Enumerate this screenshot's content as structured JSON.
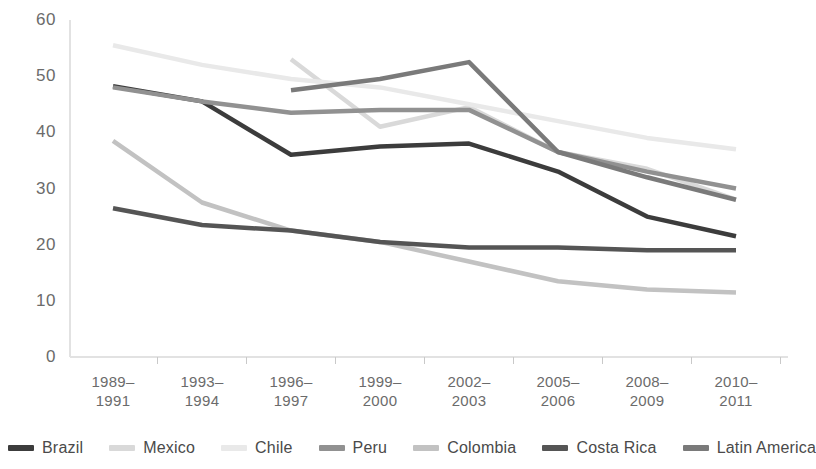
{
  "chart_data": {
    "type": "line",
    "title": "",
    "subtitle": "",
    "xlabel": "",
    "ylabel": "",
    "ylim": [
      0,
      60
    ],
    "ytick_values": [
      60,
      50,
      40,
      30,
      20,
      10,
      0
    ],
    "ytick_labels": [
      "60",
      "50",
      "40",
      "30",
      "20",
      "10",
      "0"
    ],
    "grid": false,
    "legend_position": "bottom",
    "categories": [
      "1989–\n1991",
      "1993–\n1994",
      "1996–\n1997",
      "1999–\n2000",
      "2002–\n2003",
      "2005–\n2006",
      "2008–\n2009",
      "2010–\n2011"
    ],
    "series": [
      {
        "name": "Brazil",
        "color": "#3c3c3c",
        "values": [
          48.2,
          45.5,
          36.0,
          37.5,
          38.0,
          33.0,
          25.0,
          21.5
        ]
      },
      {
        "name": "Mexico",
        "color": "#d9d9d9",
        "values": [
          null,
          null,
          53.0,
          41.0,
          44.5,
          36.5,
          33.5,
          28.0
        ]
      },
      {
        "name": "Chile",
        "color": "#e9e9e9",
        "values": [
          55.5,
          52.0,
          49.5,
          48.0,
          45.0,
          42.0,
          39.0,
          37.0
        ]
      },
      {
        "name": "Peru",
        "color": "#919191",
        "values": [
          48.0,
          45.5,
          43.5,
          44.0,
          44.0,
          36.5,
          33.0,
          30.0
        ]
      },
      {
        "name": "Colombia",
        "color": "#c2c2c2",
        "values": [
          38.5,
          27.5,
          22.5,
          20.5,
          17.0,
          13.5,
          12.0,
          11.5
        ]
      },
      {
        "name": "Costa Rica",
        "color": "#555555",
        "values": [
          26.5,
          23.5,
          22.5,
          20.5,
          19.5,
          19.5,
          19.0,
          19.0
        ]
      },
      {
        "name": "Latin America",
        "color": "#7a7a7a",
        "values": [
          null,
          null,
          47.5,
          49.5,
          52.5,
          36.5,
          32.0,
          28.0
        ]
      }
    ]
  },
  "axis": {
    "axis_line_color": "#e2e2e2",
    "tick_color": "#c9c9c9"
  },
  "legend": {
    "items": [
      {
        "label": "Brazil",
        "color": "#3c3c3c"
      },
      {
        "label": "Mexico",
        "color": "#d9d9d9"
      },
      {
        "label": "Chile",
        "color": "#e9e9e9"
      },
      {
        "label": "Peru",
        "color": "#919191"
      },
      {
        "label": "Colombia",
        "color": "#c2c2c2"
      },
      {
        "label": "Costa Rica",
        "color": "#555555"
      },
      {
        "label": "Latin America",
        "color": "#7a7a7a"
      }
    ]
  }
}
